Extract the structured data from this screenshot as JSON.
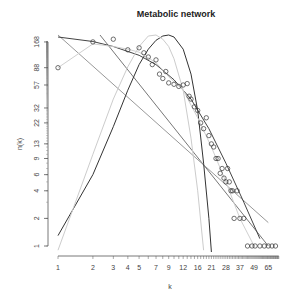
{
  "chart_data": {
    "type": "scatter",
    "title": "Metabolic network",
    "xlabel": "k",
    "ylabel": "n(k)",
    "x_scale": "log",
    "y_scale": "log",
    "x_tick_labels": [
      "1",
      "2",
      "3",
      "4",
      "5",
      "7",
      "9",
      "12",
      "16",
      "21",
      "28",
      "37",
      "49",
      "65"
    ],
    "x_ticks": [
      1,
      2,
      3,
      4,
      5,
      7,
      9,
      12,
      16,
      21,
      28,
      37,
      49,
      65
    ],
    "y_tick_labels": [
      "1",
      "2",
      "4",
      "6",
      "9",
      "13",
      "22",
      "32",
      "57",
      "88",
      "168"
    ],
    "y_ticks": [
      1,
      2,
      4,
      6,
      9,
      13,
      22,
      32,
      57,
      88,
      168
    ],
    "xlim": [
      1,
      80
    ],
    "ylim": [
      0.85,
      200
    ],
    "grid": false,
    "legend": null,
    "points": {
      "name": "observed degree distribution",
      "marker": "open-circle",
      "x": [
        1,
        2,
        3,
        4,
        5,
        5.5,
        6,
        6.5,
        7,
        7.5,
        8,
        8.5,
        9,
        10,
        11,
        12,
        13,
        13.5,
        14,
        15,
        16,
        17,
        18,
        19,
        20,
        21,
        22,
        23,
        24,
        25,
        26,
        27,
        28,
        29,
        30,
        31,
        32,
        33,
        35,
        37,
        40,
        43,
        47,
        50,
        55,
        60,
        65,
        70,
        75
      ],
      "y": [
        88,
        168,
        180,
        138,
        145,
        128,
        115,
        95,
        107,
        75,
        67,
        80,
        60,
        58,
        55,
        57,
        59,
        43,
        40,
        33,
        30,
        22,
        19,
        25,
        16,
        13,
        12,
        9,
        9,
        6.2,
        7,
        5.5,
        5,
        7,
        5,
        4,
        4,
        2,
        4,
        2,
        2,
        1,
        1,
        1,
        1,
        1,
        1,
        1,
        1
      ]
    },
    "series": [
      {
        "name": "power-law fit (steep line)",
        "color": "#777777",
        "type": "line",
        "x": [
          2.3,
          65
        ],
        "y": [
          200,
          1
        ]
      },
      {
        "name": "power-law fit (shallow line)",
        "color": "#999999",
        "type": "line",
        "x": [
          1,
          65
        ],
        "y": [
          200,
          1.8
        ]
      },
      {
        "name": "exponential-cutoff fit",
        "color": "#444444",
        "type": "line",
        "x": [
          1,
          2,
          3,
          5,
          7,
          10,
          14,
          20,
          28,
          40,
          55
        ],
        "y": [
          190,
          170,
          150,
          120,
          95,
          65,
          40,
          19,
          8,
          3,
          1.2
        ]
      },
      {
        "name": "Poisson fit",
        "color": "#333333",
        "type": "line",
        "x": [
          1,
          2,
          3,
          4,
          5,
          6,
          7,
          8,
          9,
          10,
          12,
          14,
          16,
          18,
          20,
          21
        ],
        "y": [
          1.3,
          6,
          20,
          50,
          95,
          140,
          175,
          195,
          200,
          190,
          140,
          75,
          30,
          8,
          2,
          0.85
        ]
      },
      {
        "name": "light gray fit",
        "color": "#cccccc",
        "type": "line",
        "x": [
          1,
          2,
          3,
          4,
          5,
          6,
          7,
          8,
          9,
          10,
          12,
          14,
          16,
          18
        ],
        "y": [
          0.9,
          10,
          40,
          90,
          150,
          195,
          200,
          180,
          150,
          110,
          50,
          15,
          4,
          0.9
        ]
      },
      {
        "name": "smoothed data (light)",
        "color": "#d0d0d0",
        "type": "line",
        "x": [
          1,
          2,
          3,
          4,
          5,
          7,
          9,
          12,
          16,
          21,
          28,
          37,
          49
        ],
        "y": [
          88,
          160,
          150,
          140,
          130,
          100,
          70,
          50,
          25,
          12,
          5,
          2,
          1
        ]
      }
    ]
  }
}
